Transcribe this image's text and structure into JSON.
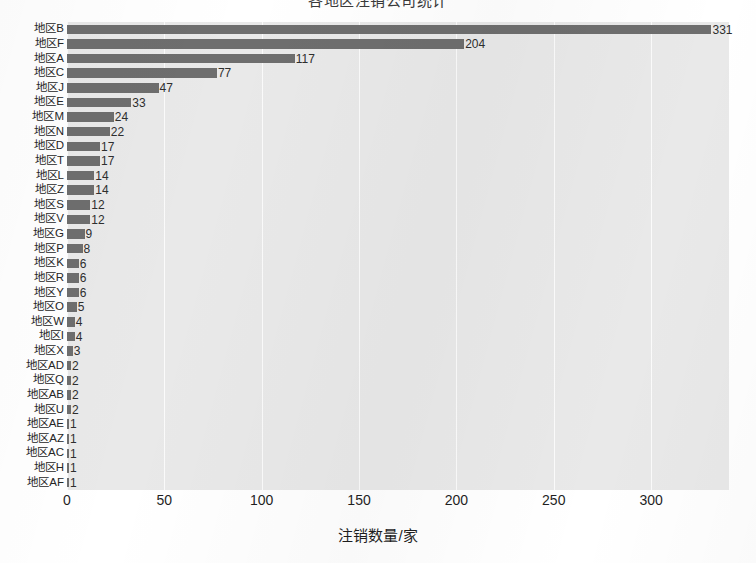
{
  "chart_data": {
    "type": "bar",
    "orientation": "horizontal",
    "title": "各地区注销公司统计",
    "xlabel": "注销数量/家",
    "ylabel": "",
    "xlim": [
      0,
      340
    ],
    "xticks": [
      0,
      50,
      100,
      150,
      200,
      250,
      300
    ],
    "grid": "vertical",
    "legend": null,
    "categories": [
      "地区B",
      "地区F",
      "地区A",
      "地区C",
      "地区J",
      "地区E",
      "地区M",
      "地区N",
      "地区D",
      "地区T",
      "地区L",
      "地区Z",
      "地区S",
      "地区V",
      "地区G",
      "地区P",
      "地区K",
      "地区R",
      "地区Y",
      "地区O",
      "地区W",
      "地区I",
      "地区X",
      "地区AD",
      "地区Q",
      "地区AB",
      "地区U",
      "地区AE",
      "地区AZ",
      "地区AC",
      "地区H",
      "地区AF"
    ],
    "values": [
      331,
      204,
      117,
      77,
      47,
      33,
      24,
      22,
      17,
      17,
      14,
      14,
      12,
      12,
      9,
      8,
      6,
      6,
      6,
      5,
      4,
      4,
      3,
      2,
      2,
      2,
      2,
      1,
      1,
      1,
      1,
      1
    ],
    "bar_labels": [
      "331",
      "204",
      "117",
      "77",
      "47",
      "33",
      "24",
      "22",
      "17",
      "17",
      "14",
      "14",
      "12",
      "12",
      "9",
      "8",
      "6",
      "6",
      "6",
      "5",
      "4",
      "4",
      "3",
      "2",
      "2",
      "2",
      "2",
      "1",
      "1",
      "1",
      "1",
      "1"
    ],
    "colors": {
      "bar": "#6e6e6e",
      "plot_background": "#e9e9e9",
      "gridline": "#fbfbfb",
      "text": "#262626",
      "figure_background": "#ffffff"
    }
  }
}
